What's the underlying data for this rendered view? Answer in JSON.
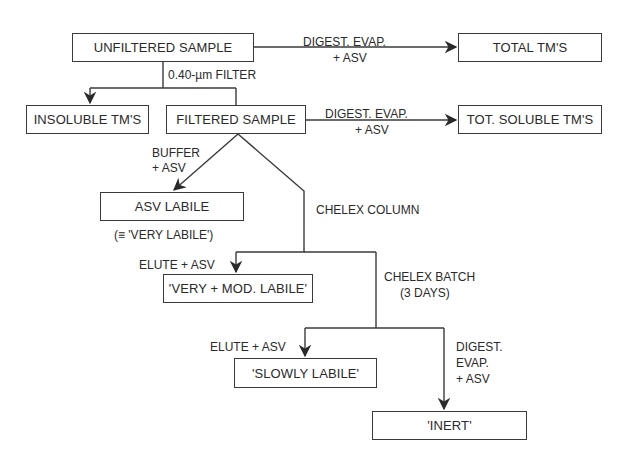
{
  "diagram": {
    "type": "flowchart",
    "nodes": {
      "unfiltered": "UNFILTERED SAMPLE",
      "total": "TOTAL TM'S",
      "insoluble": "INSOLUBLE TM'S",
      "filtered": "FILTERED SAMPLE",
      "tot_soluble": "TOT. SOLUBLE TM'S",
      "asv_labile": "ASV LABILE",
      "asv_labile_note": "(≡ 'VERY LABILE')",
      "very_mod_labile": "'VERY + MOD. LABILE'",
      "slowly_labile": "'SLOWLY LABILE'",
      "inert": "'INERT'"
    },
    "edges": {
      "unfiltered_to_total_l1": "DIGEST. EVAP.",
      "unfiltered_to_total_l2": "+ ASV",
      "filter": "0.40-µm FILTER",
      "filtered_to_soluble_l1": "DIGEST. EVAP.",
      "filtered_to_soluble_l2": "+ ASV",
      "buffer_l1": "BUFFER",
      "buffer_l2": "+ ASV",
      "chelex_column": "CHELEX COLUMN",
      "elute1": "ELUTE + ASV",
      "chelex_batch_l1": "CHELEX BATCH",
      "chelex_batch_l2": "(3 DAYS)",
      "elute2": "ELUTE + ASV",
      "digest_l1": "DIGEST.",
      "digest_l2": "EVAP.",
      "digest_l3": "+ ASV"
    }
  }
}
